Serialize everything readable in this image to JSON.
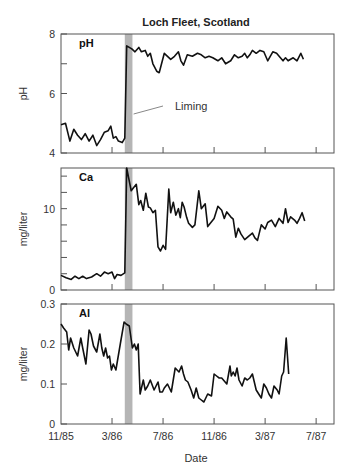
{
  "chart_data": [
    {
      "type": "line",
      "title": "Loch Fleet, Scotland",
      "panel_label": "pH",
      "ylabel": "pH",
      "xlabel": "",
      "x_unit": "months since 11/85",
      "ylim": [
        4,
        8
      ],
      "yticks": [
        4,
        6,
        8
      ],
      "ytick_labels": [
        "4",
        "6",
        "8"
      ],
      "yminor": [
        7
      ],
      "annotation": {
        "text": "Liming",
        "x": 5.3
      },
      "liming_band": [
        5.0,
        5.6
      ],
      "series": [
        {
          "name": "pH",
          "x": [
            0,
            0.35,
            0.7,
            1.0,
            1.3,
            1.6,
            1.9,
            2.2,
            2.5,
            2.8,
            3.1,
            3.4,
            3.7,
            3.9,
            4.1,
            4.3,
            4.5,
            4.8,
            5.0,
            5.15,
            5.55,
            5.8,
            6.1,
            6.3,
            6.6,
            6.8,
            7.0,
            7.2,
            7.5,
            7.7,
            8.1,
            8.6,
            8.9,
            9.2,
            9.4,
            9.6,
            9.9,
            10.3,
            10.7,
            11.0,
            11.3,
            11.6,
            11.9,
            12.3,
            12.6,
            12.9,
            13.3,
            13.6,
            13.9,
            14.2,
            14.4,
            14.6,
            14.8,
            15.0,
            15.3,
            15.6,
            15.9,
            16.2,
            16.6,
            16.9,
            17.2,
            17.4,
            17.6,
            17.8,
            18.0,
            18.2,
            18.5,
            18.8,
            19.0
          ],
          "values": [
            4.95,
            5.0,
            4.4,
            4.8,
            4.6,
            4.45,
            4.65,
            4.4,
            4.6,
            4.25,
            4.45,
            4.7,
            4.75,
            4.9,
            4.5,
            4.55,
            4.4,
            4.35,
            4.5,
            7.6,
            7.5,
            7.4,
            7.55,
            7.4,
            7.45,
            7.25,
            7.35,
            7.0,
            6.75,
            6.7,
            7.35,
            7.15,
            7.25,
            7.4,
            7.1,
            6.95,
            7.3,
            7.25,
            7.35,
            7.3,
            7.2,
            7.25,
            7.2,
            7.1,
            7.2,
            7.0,
            7.1,
            7.3,
            7.2,
            7.25,
            7.35,
            7.2,
            7.3,
            7.45,
            7.35,
            7.45,
            7.4,
            7.1,
            7.4,
            7.35,
            7.2,
            7.1,
            7.2,
            7.1,
            7.15,
            7.2,
            7.1,
            7.35,
            7.15
          ]
        }
      ]
    },
    {
      "type": "line",
      "panel_label": "Ca",
      "ylabel": "mg/liter",
      "xlabel": "",
      "x_unit": "months since 11/85",
      "ylim": [
        0,
        15
      ],
      "yticks": [
        0,
        10
      ],
      "ytick_labels": [
        "0",
        "10"
      ],
      "yminor": [
        2,
        4,
        6,
        8,
        12,
        14
      ],
      "liming_band": [
        5.0,
        5.6
      ],
      "series": [
        {
          "name": "Ca",
          "x": [
            0,
            0.4,
            0.8,
            1.1,
            1.4,
            1.7,
            2.0,
            2.4,
            2.8,
            3.1,
            3.4,
            3.7,
            4.0,
            4.2,
            4.4,
            4.7,
            5.0,
            5.15,
            5.5,
            5.65,
            5.9,
            6.1,
            6.25,
            6.45,
            6.65,
            6.85,
            7.0,
            7.2,
            7.4,
            7.6,
            7.8,
            8.0,
            8.2,
            8.45,
            8.6,
            8.8,
            9.0,
            9.2,
            9.35,
            9.5,
            9.65,
            9.85,
            10.0,
            10.3,
            10.5,
            10.8,
            11.0,
            11.3,
            11.5,
            11.7,
            12.0,
            12.3,
            12.6,
            12.8,
            13.0,
            13.3,
            13.5,
            13.7,
            13.9,
            14.1,
            14.4,
            14.7,
            15.0,
            15.2,
            15.4,
            15.7,
            16.0,
            16.2,
            16.5,
            16.8,
            17.1,
            17.4,
            17.6,
            17.8,
            18.0,
            18.3,
            18.5,
            18.7,
            18.9,
            19.1
          ],
          "values": [
            1.8,
            1.5,
            1.3,
            1.7,
            1.4,
            1.7,
            1.4,
            1.6,
            2.0,
            1.7,
            2.2,
            2.0,
            2.2,
            1.4,
            1.9,
            1.8,
            2.1,
            15.0,
            12.2,
            12.5,
            13.0,
            10.5,
            11.0,
            9.8,
            11.9,
            10.2,
            10.1,
            9.5,
            9.8,
            5.3,
            4.8,
            5.5,
            5.0,
            12.4,
            9.5,
            10.8,
            9.2,
            10.0,
            8.9,
            10.8,
            10.2,
            8.9,
            8.2,
            7.7,
            8.0,
            12.2,
            10.0,
            10.6,
            7.8,
            8.2,
            8.8,
            10.3,
            9.8,
            8.8,
            9.6,
            9.0,
            8.7,
            6.5,
            7.6,
            6.9,
            6.2,
            6.6,
            7.0,
            6.4,
            6.1,
            8.0,
            7.5,
            8.3,
            8.6,
            7.8,
            8.8,
            8.2,
            10.0,
            8.3,
            9.0,
            8.6,
            8.2,
            8.8,
            9.5,
            8.5
          ]
        }
      ]
    },
    {
      "type": "line",
      "panel_label": "Al",
      "ylabel": "mg/liter",
      "xlabel": "Date",
      "x_unit": "months since 11/85",
      "ylim": [
        0,
        0.3
      ],
      "yticks": [
        0,
        0.1,
        0.2,
        0.3
      ],
      "ytick_labels": [
        "0",
        "0.1",
        "0.2",
        "0.3"
      ],
      "xticks": [
        0,
        4,
        8,
        12,
        16,
        20
      ],
      "xtick_labels": [
        "11/85",
        "3/86",
        "7/86",
        "11/86",
        "3/87",
        "7/87"
      ],
      "xlim": [
        0,
        21.4
      ],
      "liming_band": [
        5.0,
        5.6
      ],
      "series": [
        {
          "name": "Al",
          "x": [
            0,
            0.2,
            0.45,
            0.6,
            0.75,
            1.0,
            1.3,
            1.55,
            1.7,
            1.95,
            2.2,
            2.35,
            2.55,
            2.8,
            3.05,
            3.2,
            3.35,
            3.5,
            3.65,
            3.8,
            3.95,
            4.1,
            4.3,
            4.65,
            4.95,
            5.1,
            5.35,
            5.6,
            5.75,
            5.9,
            6.05,
            6.2,
            6.45,
            6.6,
            6.8,
            7.0,
            7.3,
            7.6,
            7.75,
            7.95,
            8.1,
            8.35,
            8.65,
            8.95,
            9.25,
            9.45,
            9.6,
            9.75,
            9.95,
            10.2,
            10.4,
            10.6,
            10.8,
            11.0,
            11.2,
            11.5,
            11.8,
            12.0,
            12.2,
            12.4,
            12.6,
            13.0,
            13.25,
            13.35,
            13.5,
            13.65,
            13.8,
            13.95,
            14.2,
            14.4,
            14.6,
            14.8,
            15.0,
            15.3,
            15.5,
            15.7,
            15.9,
            16.1,
            16.3,
            16.5,
            16.7,
            16.95,
            17.1,
            17.3,
            17.45,
            17.65,
            17.85
          ],
          "values": [
            0.25,
            0.24,
            0.23,
            0.185,
            0.215,
            0.19,
            0.17,
            0.215,
            0.19,
            0.15,
            0.235,
            0.225,
            0.195,
            0.18,
            0.225,
            0.19,
            0.17,
            0.19,
            0.165,
            0.17,
            0.135,
            0.15,
            0.135,
            0.2,
            0.255,
            0.25,
            0.245,
            0.19,
            0.2,
            0.185,
            0.2,
            0.075,
            0.11,
            0.085,
            0.095,
            0.11,
            0.085,
            0.105,
            0.08,
            0.08,
            0.09,
            0.1,
            0.08,
            0.14,
            0.13,
            0.145,
            0.125,
            0.11,
            0.105,
            0.085,
            0.065,
            0.09,
            0.065,
            0.06,
            0.055,
            0.075,
            0.07,
            0.125,
            0.12,
            0.115,
            0.115,
            0.1,
            0.145,
            0.12,
            0.13,
            0.12,
            0.14,
            0.11,
            0.095,
            0.115,
            0.11,
            0.115,
            0.125,
            0.085,
            0.075,
            0.065,
            0.1,
            0.09,
            0.075,
            0.065,
            0.095,
            0.085,
            0.075,
            0.12,
            0.13,
            0.215,
            0.125
          ]
        }
      ]
    }
  ]
}
